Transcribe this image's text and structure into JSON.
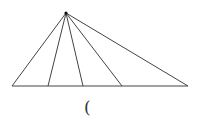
{
  "diagram": {
    "type": "triangle-with-cevians",
    "apex": {
      "x": 66,
      "y": 13
    },
    "baseline": {
      "y": 86,
      "x_start": 12,
      "x_end": 188
    },
    "base_points_x": [
      12,
      48,
      83,
      122,
      188
    ],
    "line_color": "#444444",
    "apex_dot_color": "#111111"
  },
  "caption": {
    "text": "("
  }
}
